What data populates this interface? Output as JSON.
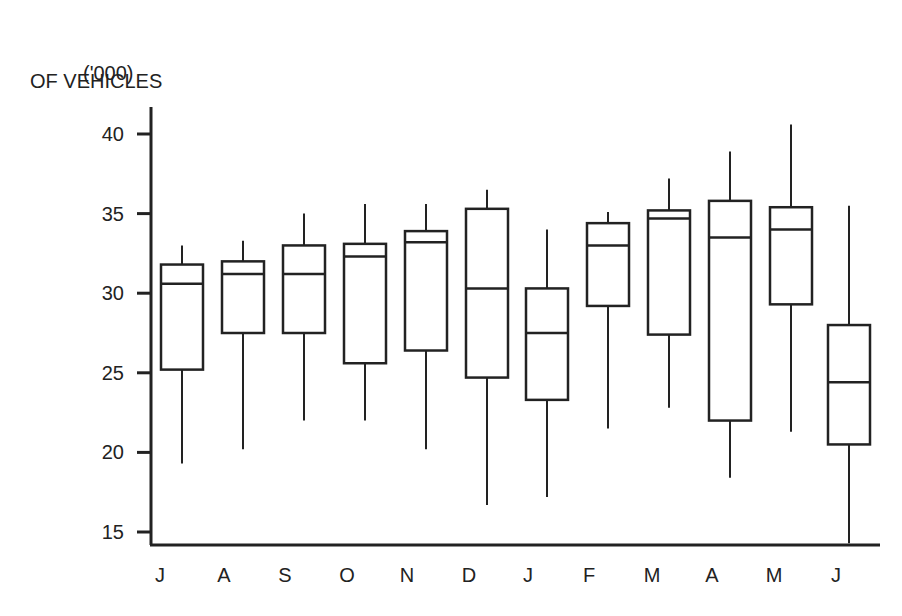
{
  "chart_data": {
    "type": "box",
    "title": "",
    "ylabel_lines": [
      "('000)",
      "OF VEHICLES"
    ],
    "xlabel": "",
    "ylim": [
      15,
      40
    ],
    "yticks": [
      15,
      20,
      25,
      30,
      35,
      40
    ],
    "grid": false,
    "legend": null,
    "categories": [
      "J",
      "A",
      "S",
      "O",
      "N",
      "D",
      "J",
      "F",
      "M",
      "A",
      "M",
      "J"
    ],
    "boxes": [
      {
        "month": "J",
        "whisker_high": 33.0,
        "q3": 31.8,
        "median": 30.6,
        "q1": 25.2,
        "whisker_low": 19.3
      },
      {
        "month": "A",
        "whisker_high": 33.3,
        "q3": 32.0,
        "median": 31.2,
        "q1": 27.5,
        "whisker_low": 20.2
      },
      {
        "month": "S",
        "whisker_high": 35.0,
        "q3": 33.0,
        "median": 31.2,
        "q1": 27.5,
        "whisker_low": 22.0
      },
      {
        "month": "O",
        "whisker_high": 35.6,
        "q3": 33.1,
        "median": 32.3,
        "q1": 25.6,
        "whisker_low": 22.0
      },
      {
        "month": "N",
        "whisker_high": 35.6,
        "q3": 33.9,
        "median": 33.2,
        "q1": 26.4,
        "whisker_low": 20.2
      },
      {
        "month": "D",
        "whisker_high": 36.5,
        "q3": 35.3,
        "median": 30.3,
        "q1": 24.7,
        "whisker_low": 16.7
      },
      {
        "month": "J",
        "whisker_high": 34.0,
        "q3": 30.3,
        "median": 27.5,
        "q1": 23.3,
        "whisker_low": 17.2
      },
      {
        "month": "F",
        "whisker_high": 35.1,
        "q3": 34.4,
        "median": 33.0,
        "q1": 29.2,
        "whisker_low": 21.5
      },
      {
        "month": "M",
        "whisker_high": 37.2,
        "q3": 35.2,
        "median": 34.7,
        "q1": 27.4,
        "whisker_low": 22.8
      },
      {
        "month": "A",
        "whisker_high": 38.9,
        "q3": 35.8,
        "median": 33.5,
        "q1": 22.0,
        "whisker_low": 18.4
      },
      {
        "month": "M",
        "whisker_high": 40.6,
        "q3": 35.4,
        "median": 34.0,
        "q1": 29.3,
        "whisker_low": 21.3
      },
      {
        "month": "J",
        "whisker_high": 35.5,
        "q3": 28.0,
        "median": 24.4,
        "q1": 20.5,
        "whisker_low": 14.3
      }
    ]
  },
  "layout": {
    "plot_left": 151,
    "plot_bottom": 545,
    "plot_right": 880,
    "y_top_px": 134,
    "y_top_val": 40,
    "y_bottom_px": 532,
    "y_bottom_val": 15,
    "axis_top_px": 107,
    "box_centers": [
      182,
      243,
      304,
      365,
      426,
      487,
      547,
      608,
      669,
      730,
      791,
      849
    ],
    "box_half_width": 21,
    "line_color": "#222222"
  }
}
